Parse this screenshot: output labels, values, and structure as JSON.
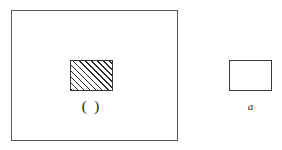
{
  "figure": {
    "background_color": "#ffffff",
    "line_color": "#3a3a3a",
    "frame_color": "#595959",
    "hatch_color": "#2b2b2b",
    "text_color": "#1c1c1c",
    "outer_frame_label": "",
    "inner_hatched_label": "( )",
    "outside_rect_label": "a",
    "icons": {
      "hatched_fill": "diagonal-hatch-pattern"
    }
  },
  "chart_data": {
    "type": "diagram",
    "title": "",
    "shapes": [
      {
        "name": "outer-frame",
        "kind": "rectangle",
        "x": 11,
        "y": 10,
        "width": 167,
        "height": 131,
        "fill": "none",
        "stroke": "#595959",
        "label": ""
      },
      {
        "name": "inner-hatched-rect",
        "kind": "rectangle",
        "x": 70,
        "y": 60,
        "width": 43,
        "height": 31,
        "fill": "diagonal-hatch",
        "hatch_angle_deg": 45,
        "hatch_spacing_px": 4.3,
        "stroke": "#3a3a3a",
        "label": "( )"
      },
      {
        "name": "outside-plain-rect",
        "kind": "rectangle",
        "x": 229,
        "y": 60,
        "width": 43,
        "height": 31,
        "fill": "none",
        "stroke": "#3a3a3a",
        "label": "a"
      }
    ],
    "annotations": [
      {
        "text": "( )",
        "x": 91,
        "y": 106,
        "style": "upright"
      },
      {
        "text": "a",
        "x": 250,
        "y": 107,
        "style": "italic"
      }
    ]
  }
}
